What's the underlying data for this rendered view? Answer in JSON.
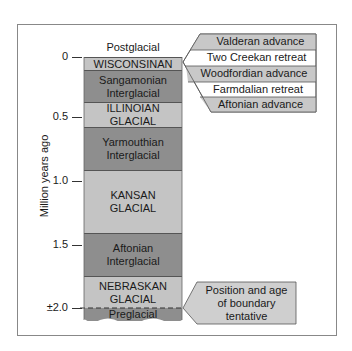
{
  "diagram": {
    "type": "stratigraphic-column",
    "y_axis": {
      "label": "Million years ago",
      "ticks": [
        "0",
        "0.5",
        "1.0",
        "1.5",
        "±2.0"
      ]
    },
    "top_label": "Postglacial",
    "layers": [
      {
        "name": "WISCONSINAN",
        "line2": "",
        "shade": "light"
      },
      {
        "name": "Sangamonian",
        "line2": "Interglacial",
        "shade": "dark"
      },
      {
        "name": "ILLINOIAN",
        "line2": "GLACIAL",
        "shade": "light"
      },
      {
        "name": "Yarmouthian",
        "line2": "Interglacial",
        "shade": "dark"
      },
      {
        "name": "KANSAN",
        "line2": "GLACIAL",
        "shade": "light"
      },
      {
        "name": "Aftonian",
        "line2": "Interglacial",
        "shade": "dark"
      },
      {
        "name": "NEBRASKAN",
        "line2": "GLACIAL",
        "shade": "light"
      },
      {
        "name": "Preglacial",
        "line2": "",
        "shade": "dark"
      }
    ],
    "wisconsinan_callout": {
      "items": [
        "Valderan advance",
        "Two Creekan retreat",
        "Woodfordian advance",
        "Farmdalian retreat",
        "Aftonian advance"
      ]
    },
    "boundary_callout": {
      "lines": [
        "Position and age",
        "of boundary",
        "tentative"
      ]
    },
    "colors": {
      "light_layer": "#c4c4c4",
      "dark_layer": "#8e8e8e",
      "callout_shaded": "#c8c8c8",
      "callout_white": "#ffffff"
    }
  }
}
